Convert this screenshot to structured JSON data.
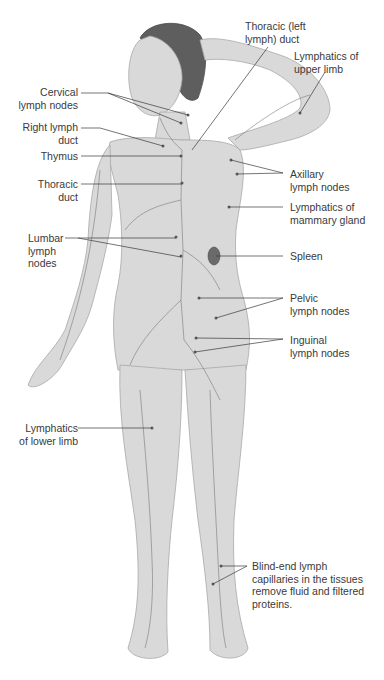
{
  "diagram": {
    "colors": {
      "skin": "#d9d9d9",
      "skin_dark": "#bdbdbd",
      "vessel": "#7a7a7a",
      "hair": "#5e5e5e",
      "leader_line": "#3a3a3a",
      "spleen": "#6a6a6a"
    },
    "labels": [
      {
        "id": "thoracic-left-duct",
        "text": "Thoracic (left\nlymph) duct"
      },
      {
        "id": "lymphatics-upper-limb",
        "text": "Lymphatics of\nupper limb"
      },
      {
        "id": "cervical-lymph-nodes",
        "text": "Cervical\nlymph nodes"
      },
      {
        "id": "right-lymph-duct",
        "text": "Right lymph\nduct"
      },
      {
        "id": "thymus",
        "text": "Thymus"
      },
      {
        "id": "thoracic-duct",
        "text": "Thoracic\nduct"
      },
      {
        "id": "axillary-lymph-nodes",
        "text": "Axillary\nlymph nodes"
      },
      {
        "id": "lymphatics-mammary-gland",
        "text": "Lymphatics of\nmammary gland"
      },
      {
        "id": "lumbar-lymph-nodes",
        "text": "Lumbar\nlymph\nnodes"
      },
      {
        "id": "spleen",
        "text": "Spleen"
      },
      {
        "id": "pelvic-lymph-nodes",
        "text": "Pelvic\nlymph nodes"
      },
      {
        "id": "inguinal-lymph-nodes",
        "text": "Inguinal\nlymph nodes"
      },
      {
        "id": "lymphatics-lower-limb",
        "text": "Lymphatics\nof lower limb"
      },
      {
        "id": "blind-end-capillaries",
        "text": "Blind-end lymph\ncapillaries in the tissues\nremove fluid and filtered\nproteins."
      }
    ]
  }
}
